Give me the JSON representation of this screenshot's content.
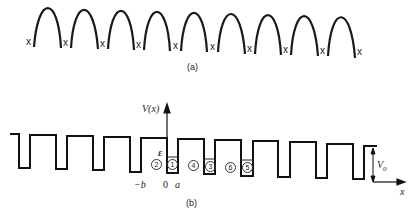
{
  "figure_a": {
    "caption": "(a)",
    "atom_marker": "x",
    "arch_count": 9,
    "marker_count": 10
  },
  "figure_b": {
    "caption": "(b)",
    "y_axis_label": "V(x)",
    "x_axis_label": "x",
    "energy_label": "ε",
    "barrier_label": "V",
    "barrier_subscript": "0",
    "tick_neg_b": "−b",
    "tick_zero": "0",
    "tick_a": "a",
    "regions": [
      "1",
      "2",
      "3",
      "4",
      "5",
      "6"
    ]
  }
}
